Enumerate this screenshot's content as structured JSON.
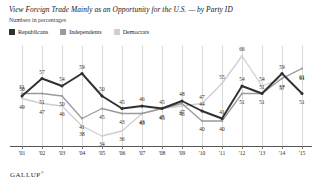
{
  "header": {
    "title": "View Foreign Trade Mainly as an Opportunity for the U.S. — by Party ID",
    "subtitle": "Numbers in percentages"
  },
  "footer": {
    "brand": "GALLUP",
    "brand_mark": "®"
  },
  "legend": {
    "position": "top-left",
    "items": [
      {
        "label": "Republicans",
        "color": "#2f2f2f"
      },
      {
        "label": "Independents",
        "color": "#9a9a9a"
      },
      {
        "label": "Democrats",
        "color": "#cfcfcf"
      }
    ]
  },
  "chart_data": {
    "type": "line",
    "title": "View Foreign Trade Mainly as an Opportunity for the U.S. — by Party ID",
    "subtitle": "Numbers in percentages",
    "xlabel": "",
    "ylabel": "",
    "ylim": [
      30,
      70
    ],
    "grid": "vertical",
    "legend_position": "top-left",
    "categories": [
      "'01",
      "'02",
      "'03",
      "'04",
      "'05",
      "'06",
      "'07",
      "'08",
      "'09",
      "'10",
      "'11",
      "'12",
      "'13",
      "'14",
      "'15"
    ],
    "series": [
      {
        "name": "Republicans",
        "color": "#2f2f2f",
        "values": [
          50,
          57,
          54,
          59,
          50,
          45,
          46,
          45,
          48,
          44,
          41,
          54,
          51,
          59,
          51
        ],
        "labels": [
          "50",
          "57",
          "54",
          "59",
          "50",
          "45",
          "46",
          "45",
          "48",
          "44",
          "41",
          "54",
          "51",
          "59",
          "51"
        ]
      },
      {
        "name": "Independents",
        "color": "#9a9a9a",
        "values": [
          51,
          51,
          50,
          41,
          45,
          43,
          43,
          45,
          47,
          40,
          40,
          51,
          51,
          57,
          61
        ],
        "labels": [
          "51",
          "51",
          "50",
          "41",
          "45",
          "43",
          "43",
          "45",
          "47",
          "40",
          "40",
          "51",
          "51",
          "57",
          "61"
        ]
      },
      {
        "name": "Democrats",
        "color": "#cfcfcf",
        "values": [
          49,
          47,
          46,
          38,
          34,
          36,
          43,
          45,
          46,
          47,
          55,
          66,
          54,
          57,
          61
        ],
        "labels": [
          "49",
          "47",
          "46",
          "38",
          "34",
          "36",
          "43",
          "45",
          "46",
          "47",
          "55",
          "66",
          "54",
          "57",
          "61"
        ]
      }
    ]
  }
}
